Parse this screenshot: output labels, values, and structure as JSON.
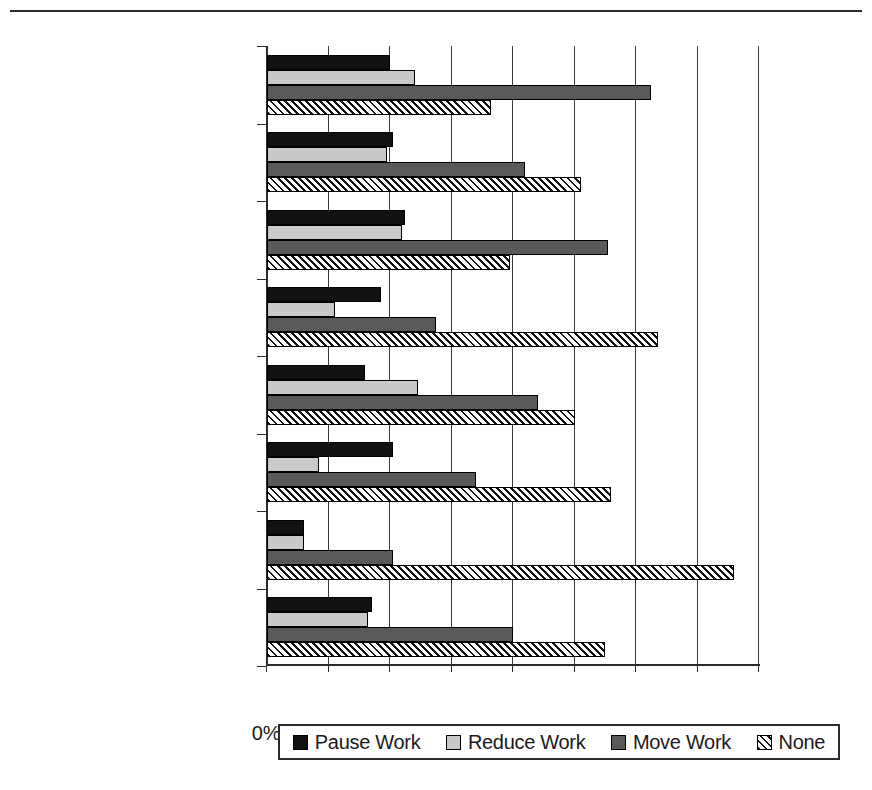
{
  "chart_data": {
    "type": "bar",
    "orientation": "horizontal",
    "title": "",
    "subtitle": "",
    "xlabel": "",
    "ylabel": "",
    "xlim": [
      0,
      80
    ],
    "xtick_labels": [
      "0%",
      "10%",
      "20%",
      "30%",
      "40%",
      "50%",
      "60%",
      "70%",
      "80%"
    ],
    "xtick_values": [
      0,
      10,
      20,
      30,
      40,
      50,
      60,
      70,
      80
    ],
    "grid": "vertical",
    "legend_position": "bottom",
    "categories": [
      "Accom & Food Service",
      "Health Care and Soc Asst",
      "Prof, Tech Scientific Serv",
      "Finance and Insurance",
      "Retail",
      "Construction",
      "Manufacturing",
      "All Organizations"
    ],
    "series": [
      {
        "name": "Pause Work",
        "color": "#111111",
        "pattern": "solid-black",
        "values": [
          20.0,
          20.5,
          22.5,
          18.5,
          16.0,
          20.5,
          6.0,
          17.0
        ]
      },
      {
        "name": "Reduce Work",
        "color": "#c9c9c9",
        "pattern": "solid-light-gray",
        "values": [
          24.0,
          19.5,
          22.0,
          11.0,
          24.5,
          8.5,
          6.0,
          16.5
        ]
      },
      {
        "name": "Move Work",
        "color": "#595959",
        "pattern": "solid-dark-gray",
        "values": [
          62.5,
          42.0,
          55.5,
          27.5,
          44.0,
          34.0,
          20.5,
          40.0
        ]
      },
      {
        "name": "None",
        "color": "#ffffff",
        "pattern": "diagonal-hatch",
        "values": [
          36.5,
          51.0,
          39.5,
          63.5,
          50.0,
          56.0,
          76.0,
          55.0
        ]
      }
    ]
  },
  "legend": {
    "items": [
      {
        "label": "Pause Work",
        "swatch": "solid-black-swatch"
      },
      {
        "label": "Reduce Work",
        "swatch": "solid-light-gray-swatch"
      },
      {
        "label": "Move Work",
        "swatch": "solid-dark-gray-swatch"
      },
      {
        "label": "None",
        "swatch": "diagonal-hatch-swatch"
      }
    ]
  }
}
